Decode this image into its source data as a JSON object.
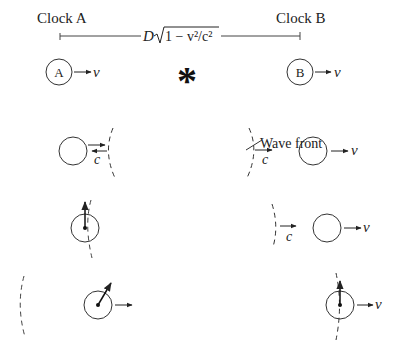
{
  "labels": {
    "clock_a": "Clock A",
    "clock_b": "Clock B",
    "distance_expr": "D√(1 − v²/c²)",
    "distance_D": "D",
    "distance_radicand": "1 − v²/c²",
    "wave_front": "Wave front",
    "clock_a_letter": "A",
    "clock_b_letter": "B",
    "velocity_symbol": "v",
    "light_speed_symbol": "c",
    "flash_symbol": "*"
  },
  "colors": {
    "ink": "#222222",
    "background": "#ffffff"
  },
  "rows": [
    {
      "name": "initial",
      "description": "Clocks A and B moving right with velocity v, flash at midpoint"
    },
    {
      "name": "wave-reaches-a",
      "description": "Wave front reaches clock A first"
    },
    {
      "name": "clock-a-starts",
      "description": "Clock A starts ticking; wave front moving toward B"
    },
    {
      "name": "wave-reaches-b",
      "description": "Wave front reaches clock B; clock B starts"
    }
  ]
}
